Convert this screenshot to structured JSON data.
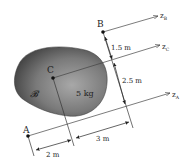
{
  "diagram": {
    "type": "rigid-body-parallel-axes",
    "body": {
      "label": "𝓑",
      "mass_label": "5 kg"
    },
    "points": {
      "A": {
        "label": "A"
      },
      "B": {
        "label": "B"
      },
      "C": {
        "label": "C"
      }
    },
    "axes": {
      "zA": {
        "label": "z",
        "sub": "A"
      },
      "zB": {
        "label": "z",
        "sub": "B"
      },
      "zC": {
        "label": "z",
        "sub": "C"
      }
    },
    "dimensions": {
      "B_to_C": "1.5 m",
      "C_to_A": "2.5 m",
      "A_to_C_along": "2 m",
      "C_to_edge_along": "3 m"
    },
    "colors": {
      "body_dark": "#3a3a3a",
      "body_light": "#9a9a9a",
      "line": "#333333",
      "background": "#ffffff"
    }
  }
}
